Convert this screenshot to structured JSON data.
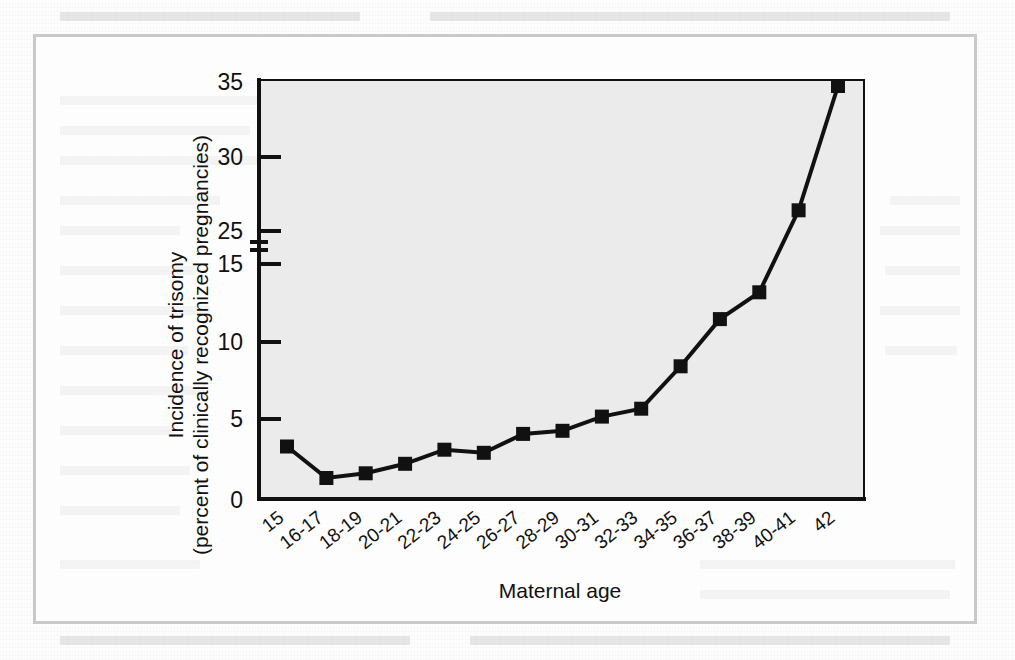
{
  "figure": {
    "plot_bg": "#ededed",
    "line_color": "#111111",
    "frame_color": "#c9c9c9",
    "axis_color": "#111111"
  },
  "axis": {
    "y_title_line1": "Incidence of trisomy",
    "y_title_line2": "(percent of clinically recognized pregnancies)",
    "x_title": "Maternal age",
    "y_ticks": [
      "0",
      "5",
      "10",
      "15",
      "25",
      "30",
      "35"
    ],
    "y_break_note": "axis break between 15 and 25"
  },
  "chart_data": {
    "type": "line",
    "title": "",
    "xlabel": "Maternal age",
    "ylabel": "Incidence of trisomy (percent of clinically recognized pregnancies)",
    "categories": [
      "15",
      "16-17",
      "18-19",
      "20-21",
      "22-23",
      "24-25",
      "26-27",
      "28-29",
      "30-31",
      "32-33",
      "34-35",
      "36-37",
      "38-39",
      "40-41",
      "42"
    ],
    "values": [
      3.4,
      1.4,
      1.7,
      2.3,
      3.2,
      3.0,
      4.2,
      4.4,
      5.3,
      5.8,
      8.5,
      11.5,
      13.2,
      26.4,
      34.8
    ],
    "ytick_values": [
      0,
      5,
      10,
      15,
      25,
      30,
      35
    ],
    "ylim": [
      0,
      35
    ],
    "y_axis_break": {
      "below": 15,
      "above": 25
    },
    "grid": false,
    "legend": null,
    "marker": "square",
    "series": [
      {
        "name": "Incidence of trisomy",
        "values": [
          3.4,
          1.4,
          1.7,
          2.3,
          3.2,
          3.0,
          4.2,
          4.4,
          5.3,
          5.8,
          8.5,
          11.5,
          13.2,
          26.4,
          34.8
        ]
      }
    ]
  }
}
